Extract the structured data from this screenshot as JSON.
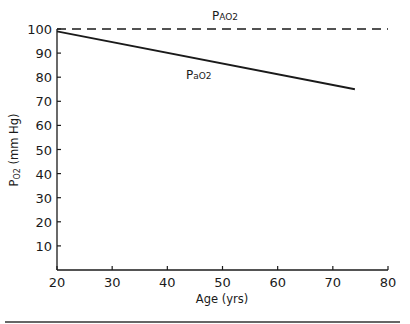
{
  "chart_data": {
    "type": "line",
    "title": "",
    "xlabel": "Age (yrs)",
    "ylabel": "PO2 (mm Hg)",
    "ylabel_main": "P",
    "ylabel_sub": "O2",
    "ylabel_rest": " (mm Hg)",
    "xlim": [
      20,
      80
    ],
    "ylim": [
      0,
      100
    ],
    "x_ticks": [
      20,
      30,
      40,
      50,
      60,
      70,
      80
    ],
    "y_ticks": [
      10,
      20,
      30,
      40,
      50,
      60,
      70,
      80,
      90,
      100
    ],
    "grid": false,
    "legend": "none (inline labels)",
    "series": [
      {
        "name": "PAO2",
        "label_main": "P",
        "label_sub": "AO2",
        "style": "dashed",
        "x": [
          20,
          80
        ],
        "values": [
          100,
          100
        ]
      },
      {
        "name": "PaO2",
        "label_main": "P",
        "label_sub": "aO2",
        "style": "solid",
        "x": [
          20,
          74
        ],
        "values": [
          99,
          75
        ]
      }
    ]
  }
}
